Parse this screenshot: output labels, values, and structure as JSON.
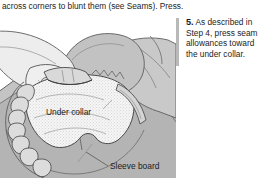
{
  "page": {
    "width": 263,
    "height": 178,
    "background": "#ffffff"
  },
  "top_text": {
    "line": "across corners to blunt them (see Seams). Press."
  },
  "step": {
    "number": "5.",
    "body": " As described in Step 4, press seam allowances toward the under collar."
  },
  "figure": {
    "caption_labels": {
      "under_collar": "Under collar",
      "sleeve_board": "Sleeve board"
    }
  },
  "colors": {
    "ink": "#1c1c1c",
    "line": "#4a4a4a",
    "board_gray": "#b0b0b0",
    "garment_gray": "#c9c9c9",
    "skin_gray": "#e6e6e6",
    "collar_fill": "#f2f2f2",
    "rule_gray": "#b9b9b9"
  }
}
